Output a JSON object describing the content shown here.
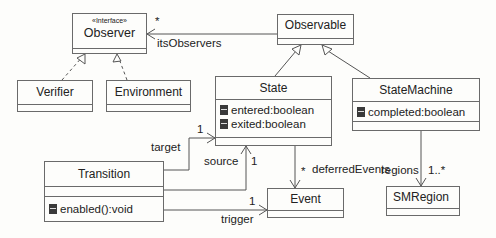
{
  "diagram": {
    "type": "UML class diagram",
    "classes": {
      "observer": {
        "stereotype": "«Interface»",
        "name": "Observer"
      },
      "observable": {
        "name": "Observable"
      },
      "verifier": {
        "name": "Verifier"
      },
      "environment": {
        "name": "Environment"
      },
      "state": {
        "name": "State",
        "attributes": [
          "entered:boolean",
          "exited:boolean"
        ]
      },
      "state_machine": {
        "name": "StateMachine",
        "attributes": [
          "completed:boolean"
        ]
      },
      "transition": {
        "name": "Transition",
        "operations": [
          "enabled():void"
        ]
      },
      "event": {
        "name": "Event"
      },
      "sm_region": {
        "name": "SMRegion"
      }
    },
    "associations": {
      "its_observers": {
        "role": "itsObservers",
        "multiplicity": "*",
        "from": "Observable",
        "to": "Observer"
      },
      "target": {
        "role": "target",
        "multiplicity": "1",
        "from": "Transition",
        "to": "State"
      },
      "source": {
        "role": "source",
        "multiplicity": "1",
        "from": "Transition",
        "to": "State"
      },
      "trigger": {
        "role": "trigger",
        "multiplicity": "1",
        "from": "Transition",
        "to": "Event"
      },
      "deferred_events": {
        "role": "deferredEvents",
        "multiplicity": "*",
        "from": "State",
        "to": "Event"
      },
      "regions": {
        "role": "regions",
        "multiplicity": "1..*",
        "from": "StateMachine",
        "to": "SMRegion"
      }
    },
    "generalizations": [
      {
        "child": "State",
        "parent": "Observable"
      },
      {
        "child": "StateMachine",
        "parent": "Observable"
      }
    ],
    "realizations": [
      {
        "child": "Verifier",
        "parent": "Observer"
      },
      {
        "child": "Environment",
        "parent": "Observer"
      }
    ]
  }
}
